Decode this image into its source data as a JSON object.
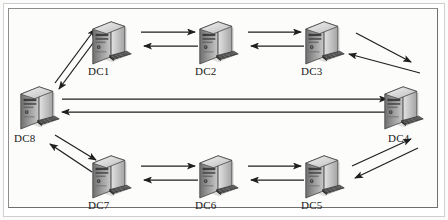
{
  "figure": {
    "type": "network-topology-diagram",
    "background_color": "#fcfcfb",
    "frame_color": "#8d8d8d",
    "line_color": "#1f1f1f",
    "label_color": "#1a1a1a"
  },
  "nodes": [
    {
      "id": "DC1",
      "label": "DC1",
      "x": 112,
      "y": 42,
      "icon": "server-tower-icon"
    },
    {
      "id": "DC2",
      "label": "DC2",
      "x": 219,
      "y": 42,
      "icon": "server-tower-icon"
    },
    {
      "id": "DC3",
      "label": "DC3",
      "x": 325,
      "y": 42,
      "icon": "server-tower-icon"
    },
    {
      "id": "DC4",
      "label": "DC4",
      "x": 404,
      "y": 107,
      "icon": "server-tower-icon"
    },
    {
      "id": "DC5",
      "label": "DC5",
      "x": 325,
      "y": 176,
      "icon": "server-tower-icon"
    },
    {
      "id": "DC6",
      "label": "DC6",
      "x": 219,
      "y": 176,
      "icon": "server-tower-icon"
    },
    {
      "id": "DC7",
      "label": "DC7",
      "x": 112,
      "y": 176,
      "icon": "server-tower-icon"
    },
    {
      "id": "DC8",
      "label": "DC8",
      "x": 40,
      "y": 107,
      "icon": "server-tower-icon"
    }
  ],
  "links": [
    {
      "from": "DC8",
      "to": "DC1",
      "direction": "bidirectional"
    },
    {
      "from": "DC1",
      "to": "DC2",
      "direction": "bidirectional"
    },
    {
      "from": "DC2",
      "to": "DC3",
      "direction": "bidirectional"
    },
    {
      "from": "DC3",
      "to": "DC4",
      "direction": "bidirectional"
    },
    {
      "from": "DC4",
      "to": "DC5",
      "direction": "bidirectional"
    },
    {
      "from": "DC5",
      "to": "DC6",
      "direction": "bidirectional"
    },
    {
      "from": "DC6",
      "to": "DC7",
      "direction": "bidirectional"
    },
    {
      "from": "DC7",
      "to": "DC8",
      "direction": "bidirectional"
    },
    {
      "from": "DC8",
      "to": "DC4",
      "direction": "bidirectional"
    }
  ]
}
